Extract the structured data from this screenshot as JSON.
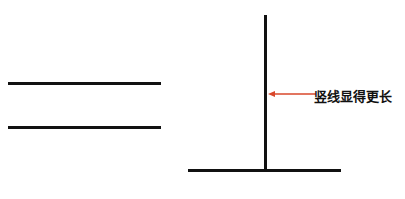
{
  "figure": {
    "annotation_label": "竖线显得更长",
    "colors": {
      "line": "#111111",
      "arrow": "#d9472b",
      "background": "#ffffff"
    },
    "left_group": {
      "description": "two parallel horizontal lines",
      "line_count": 2
    },
    "right_group": {
      "description": "inverted T: vertical line on horizontal line of equal length"
    }
  }
}
